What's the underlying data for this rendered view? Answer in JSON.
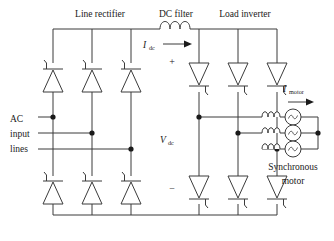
{
  "figure": {
    "type": "circuit-schematic"
  },
  "labels": {
    "line_rectifier": "Line rectifier",
    "dc_filter": "DC filter",
    "load_inverter": "Load inverter",
    "i_dc_main": "I",
    "i_dc_sub": "dc",
    "v_dc_main": "V",
    "v_dc_sub": "dc",
    "i_motor_main": "I",
    "i_motor_sub": "motor",
    "plus_sign": "+",
    "minus_sign": "−",
    "ac_line1": "AC",
    "ac_line2": "input",
    "ac_line3": "lines",
    "motor_line1": "Synchronous",
    "motor_line2": "motor"
  },
  "components": {
    "rectifier_thyristors_top": [
      "T1",
      "T3",
      "T5"
    ],
    "rectifier_thyristors_bottom": [
      "T4",
      "T6",
      "T2"
    ],
    "inverter_thyristors_top": [
      "Q1",
      "Q3",
      "Q5"
    ],
    "inverter_thyristors_bottom": [
      "Q4",
      "Q6",
      "Q2"
    ],
    "dc_link_inductor": "L-dc",
    "motor_phases": [
      "phase-a",
      "phase-b",
      "phase-c"
    ],
    "motor_source_symbol": "ac-source-icon"
  },
  "colors": {
    "background": "#ffffff",
    "wire": "#3b3b3b",
    "text": "#1a1a1a",
    "node": "#1a1a1a"
  }
}
